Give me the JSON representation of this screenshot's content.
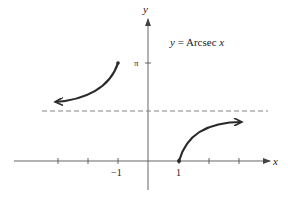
{
  "title": {
    "prefix": "y",
    "equals": " = ",
    "func": "Arcsec",
    "var": " x"
  },
  "axes": {
    "x_label": "x",
    "y_label": "y",
    "x_tick_labels": [
      {
        "value": -1,
        "text": "−1"
      },
      {
        "value": 1,
        "text": "1"
      }
    ],
    "y_tick_labels": [
      {
        "value": "pi",
        "text": "π"
      }
    ],
    "x_ticks": [
      -3,
      -2,
      -1,
      1,
      2,
      3
    ]
  },
  "asymptote": {
    "y": "pi/2",
    "style": "dashed"
  },
  "curves": [
    {
      "name": "left-branch",
      "domain": "x <= -1",
      "endpoint": {
        "x": -1,
        "y": "pi"
      },
      "direction": "toward -infinity"
    },
    {
      "name": "right-branch",
      "domain": "x >= 1",
      "endpoint": {
        "x": 1,
        "y": 0
      },
      "direction": "toward +infinity"
    }
  ],
  "colors": {
    "curve": "#2a2a2a",
    "axis": "#555555",
    "dashed": "#777777"
  }
}
